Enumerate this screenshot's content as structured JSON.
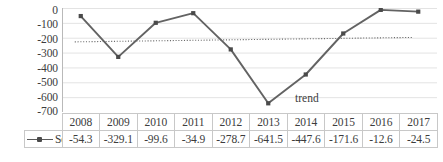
{
  "chart_data": {
    "type": "line",
    "title": "",
    "xlabel": "",
    "ylabel": "",
    "categories": [
      "2008",
      "2009",
      "2010",
      "2011",
      "2012",
      "2013",
      "2014",
      "2015",
      "2016",
      "2017"
    ],
    "series": [
      {
        "name": "Series1",
        "values": [
          -54.3,
          -329.1,
          -99.6,
          -34.9,
          -278.7,
          -641.5,
          -447.6,
          -171.6,
          -12.6,
          -24.5
        ]
      }
    ],
    "ylim": [
      -700,
      0
    ],
    "yticks": [
      "0",
      "-100",
      "-200",
      "-300",
      "-400",
      "-500",
      "-600",
      "-700"
    ],
    "ytick_values": [
      0,
      -100,
      -200,
      -300,
      -400,
      -500,
      -600,
      -700
    ],
    "grid": true,
    "legend_position": "table-left",
    "annotations": [
      {
        "name": "trend",
        "text": "trend"
      }
    ],
    "trendline": {
      "label": "trend",
      "style": "dotted",
      "start_value": -228,
      "end_value": -198,
      "color": "#6b6b6b"
    },
    "colors": {
      "series_line": "#636363",
      "marker": "#4a4a4a",
      "gridline": "#e3e3e3",
      "axis": "#b9b9b9",
      "text": "#3c3c3c",
      "table_border": "#c8c8c8"
    },
    "data_table": {
      "legend_label": "Series1",
      "marker_icon": "line-marker-icon",
      "header": [
        "2008",
        "2009",
        "2010",
        "2011",
        "2012",
        "2013",
        "2014",
        "2015",
        "2016",
        "2017"
      ],
      "row_values": [
        "-54.3",
        "-329.1",
        "-99.6",
        "-34.9",
        "-278.7",
        "-641.5",
        "-447.6",
        "-171.6",
        "-12.6",
        "-24.5"
      ]
    }
  }
}
